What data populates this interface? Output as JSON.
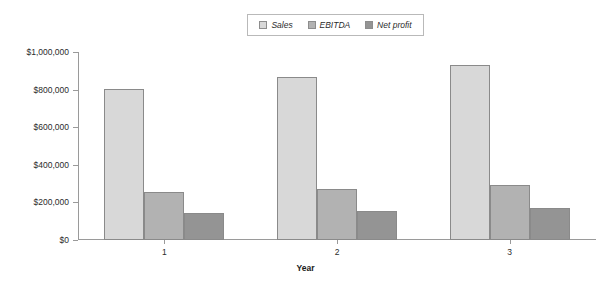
{
  "chart_data": {
    "type": "bar",
    "title": "",
    "subtitle": "",
    "xlabel": "Year",
    "ylabel": "",
    "categories": [
      "1",
      "2",
      "3"
    ],
    "series": [
      {
        "name": "Sales",
        "values": [
          805000,
          867000,
          932000
        ],
        "color": "#d8d8d8"
      },
      {
        "name": "EBITDA",
        "values": [
          255000,
          270000,
          290000
        ],
        "color": "#b2b2b2"
      },
      {
        "name": "Net profit",
        "values": [
          143000,
          155000,
          168000
        ],
        "color": "#949494"
      }
    ],
    "ylim": [
      0,
      1000000
    ],
    "ytick_values": [
      0,
      200000,
      400000,
      600000,
      800000,
      1000000
    ],
    "ytick_labels": [
      "$0",
      "$200,000",
      "$400,000",
      "$600,000",
      "$800,000",
      "$1,000,000"
    ],
    "grid": false,
    "legend_position": "top-center",
    "axis_color": "#9a9a9a",
    "bar_border_color": "#8a8a8a",
    "background": "#ffffff"
  },
  "legend": {
    "entries": [
      {
        "label": "Sales"
      },
      {
        "label": "EBITDA"
      },
      {
        "label": "Net profit"
      }
    ]
  },
  "axis": {
    "x_title": "Year"
  }
}
